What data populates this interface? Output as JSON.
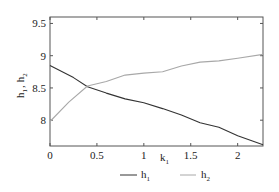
{
  "chart_data": {
    "type": "line",
    "title": "",
    "xlabel": "k1",
    "ylabel": "h1 , h2",
    "xlim": [
      0,
      2.27
    ],
    "ylim": [
      7.6,
      9.6
    ],
    "xticks": [
      0,
      0.5,
      1,
      1.5,
      2
    ],
    "xtick_labels": [
      "0",
      "0.5",
      "1",
      "1.5",
      "2"
    ],
    "yticks": [
      8,
      8.5,
      9,
      9.5
    ],
    "ytick_labels": [
      "8",
      "8.5",
      "9",
      "9.5"
    ],
    "grid": false,
    "legend_position": "below-right",
    "series": [
      {
        "name": "h1",
        "color": "#333333",
        "x": [
          0,
          0.25,
          0.4,
          0.6,
          0.8,
          1.0,
          1.2,
          1.4,
          1.6,
          1.8,
          2.0,
          2.27
        ],
        "values": [
          8.85,
          8.66,
          8.52,
          8.42,
          8.33,
          8.27,
          8.18,
          8.08,
          7.96,
          7.89,
          7.76,
          7.62
        ]
      },
      {
        "name": "h2",
        "color": "#a8a8a8",
        "x": [
          0,
          0.2,
          0.4,
          0.6,
          0.8,
          1.0,
          1.2,
          1.4,
          1.6,
          1.8,
          2.0,
          2.27
        ],
        "values": [
          7.98,
          8.28,
          8.53,
          8.6,
          8.7,
          8.73,
          8.75,
          8.84,
          8.9,
          8.92,
          8.96,
          9.02
        ]
      }
    ]
  },
  "labels": {
    "xlabel_main": "k",
    "xlabel_sub": "1",
    "ylabel_h1_main": "h",
    "ylabel_h1_sub": "1",
    "ylabel_sep": ",",
    "ylabel_h2_main": "h",
    "ylabel_h2_sub": "2",
    "legend_h1_main": "h",
    "legend_h1_sub": "1",
    "legend_h2_main": "h",
    "legend_h2_sub": "2"
  }
}
